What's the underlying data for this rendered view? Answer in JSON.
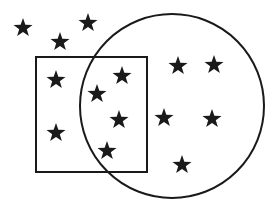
{
  "diagram": {
    "type": "venn-set-diagram",
    "stroke_color": "#1a1a1a",
    "star_color": "#1a1a1a",
    "background": "#ffffff",
    "rectangle": {
      "x": 36,
      "y": 57,
      "width": 111,
      "height": 115
    },
    "circle": {
      "cx": 172,
      "cy": 106,
      "r": 92
    },
    "stars": [
      {
        "region": "outside",
        "x": 23,
        "y": 27
      },
      {
        "region": "outside",
        "x": 60,
        "y": 41
      },
      {
        "region": "outside",
        "x": 88,
        "y": 22
      },
      {
        "region": "rectangle-only",
        "x": 56,
        "y": 79
      },
      {
        "region": "rectangle-only",
        "x": 56,
        "y": 132
      },
      {
        "region": "intersection",
        "x": 122,
        "y": 75
      },
      {
        "region": "intersection",
        "x": 97,
        "y": 93
      },
      {
        "region": "intersection",
        "x": 119,
        "y": 119
      },
      {
        "region": "intersection",
        "x": 107,
        "y": 150
      },
      {
        "region": "circle-only",
        "x": 178,
        "y": 65
      },
      {
        "region": "circle-only",
        "x": 214,
        "y": 64
      },
      {
        "region": "circle-only",
        "x": 164,
        "y": 117
      },
      {
        "region": "circle-only",
        "x": 212,
        "y": 118
      },
      {
        "region": "circle-only",
        "x": 182,
        "y": 164
      }
    ],
    "counts": {
      "total": 14,
      "outside": 3,
      "rectangle_only": 2,
      "intersection": 4,
      "circle_only": 5
    }
  }
}
